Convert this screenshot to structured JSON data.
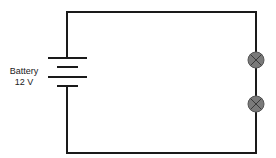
{
  "diagram": {
    "type": "circuit",
    "battery": {
      "label": "Battery",
      "voltage": "12 V"
    },
    "components": [
      {
        "type": "battery",
        "name": "Battery",
        "value": "12 V"
      },
      {
        "type": "lamp",
        "index": 1
      },
      {
        "type": "lamp",
        "index": 2
      }
    ],
    "colors": {
      "wire": "#1a1a1a",
      "lamp_fill": "#7a7a7a",
      "lamp_cross": "#3a3a3a"
    }
  }
}
